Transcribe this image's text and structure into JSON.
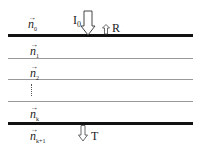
{
  "diagram": {
    "type": "multilayer thin-film stack",
    "layers": [
      {
        "name": "n_0",
        "base": "n",
        "sub": "0",
        "vec": "→"
      },
      {
        "name": "n_1",
        "base": "n",
        "sub": "1",
        "vec": "→"
      },
      {
        "name": "n_2",
        "base": "n",
        "sub": "2",
        "vec": "→"
      },
      {
        "name": "n_k",
        "base": "n",
        "sub": "k",
        "vec": "→"
      },
      {
        "name": "n_k+1",
        "base": "n",
        "sub": "k+1",
        "vec": "→"
      }
    ],
    "incident": {
      "label": "I",
      "sub": "0"
    },
    "reflected": {
      "label": "R"
    },
    "transmitted": {
      "label": "T"
    },
    "ellipsis": "⋮"
  }
}
